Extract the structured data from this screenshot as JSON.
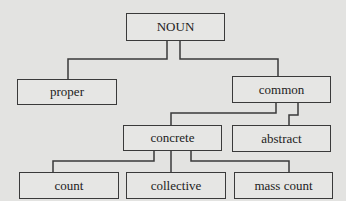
{
  "diagram": {
    "type": "tree",
    "nodes": [
      {
        "id": "noun",
        "label": "NOUN"
      },
      {
        "id": "proper",
        "label": "proper"
      },
      {
        "id": "common",
        "label": "common"
      },
      {
        "id": "concrete",
        "label": "concrete"
      },
      {
        "id": "abstract",
        "label": "abstract"
      },
      {
        "id": "count",
        "label": "count"
      },
      {
        "id": "collective",
        "label": "collective"
      },
      {
        "id": "mass_count",
        "label": "mass count"
      }
    ],
    "edges": [
      {
        "from": "noun",
        "to": "proper"
      },
      {
        "from": "noun",
        "to": "common"
      },
      {
        "from": "common",
        "to": "concrete"
      },
      {
        "from": "common",
        "to": "abstract"
      },
      {
        "from": "concrete",
        "to": "count"
      },
      {
        "from": "concrete",
        "to": "collective"
      },
      {
        "from": "concrete",
        "to": "mass_count"
      }
    ]
  }
}
